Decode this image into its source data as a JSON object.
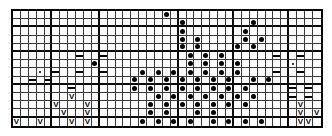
{
  "chart": {
    "type": "stitch-grid",
    "columns": 39,
    "rows": 14,
    "colors": {
      "background": "#ffffff",
      "grid_line": "#3a3a3a",
      "heavy_line": "#0a0a0a",
      "symbol": "#000000"
    },
    "symbol_legend": [
      {
        "key": "dot",
        "name": "filled-dot",
        "glyph": "●"
      },
      {
        "key": "smalldot",
        "name": "small-dot",
        "glyph": "·"
      },
      {
        "key": "dash",
        "name": "dash",
        "glyph": "—"
      },
      {
        "key": "vee",
        "name": "vee-mark",
        "glyph": "V"
      },
      {
        "key": "stipple",
        "name": "stipple-mark",
        "glyph": "∴"
      },
      {
        "key": "",
        "name": "empty-cell",
        "glyph": ""
      }
    ],
    "heavy_column_dividers": [
      4,
      10,
      20,
      27,
      34
    ],
    "heavy_row_dividers": [
      1,
      4,
      8,
      12
    ],
    "cells": [
      [
        "",
        "",
        "",
        "",
        "",
        "",
        "",
        "",
        "",
        "",
        "",
        "",
        "",
        "",
        "",
        "",
        "",
        "",
        "",
        "dot",
        "",
        "",
        "",
        "",
        "",
        "",
        "",
        "",
        "",
        "",
        "",
        "",
        "",
        "",
        "",
        "",
        "",
        "",
        ""
      ],
      [
        "",
        "",
        "",
        "",
        "",
        "",
        "",
        "",
        "",
        "",
        "",
        "",
        "",
        "",
        "",
        "",
        "",
        "",
        "",
        "",
        "",
        "dot",
        "",
        "",
        "",
        "",
        "",
        "",
        "",
        "",
        "dot",
        "",
        "",
        "",
        "",
        "",
        "",
        "",
        ""
      ],
      [
        "",
        "",
        "",
        "",
        "",
        "",
        "",
        "",
        "",
        "",
        "",
        "",
        "",
        "",
        "",
        "",
        "",
        "",
        "",
        "",
        "",
        "dot",
        "",
        "",
        "",
        "",
        "",
        "",
        "",
        "dot",
        "",
        "",
        "",
        "",
        "",
        "",
        "",
        "",
        ""
      ],
      [
        "",
        "",
        "",
        "",
        "",
        "",
        "",
        "",
        "",
        "",
        "",
        "",
        "",
        "",
        "",
        "",
        "",
        "",
        "",
        "",
        "",
        "dot",
        "",
        "dot",
        "",
        "",
        "",
        "",
        "",
        "dot",
        "",
        "dot",
        "",
        "",
        "",
        "",
        "",
        "",
        ""
      ],
      [
        "",
        "",
        "",
        "",
        "",
        "",
        "",
        "",
        "",
        "",
        "",
        "",
        "",
        "",
        "",
        "",
        "",
        "",
        "",
        "",
        "",
        "dot",
        "",
        "dot",
        "",
        "",
        "",
        "",
        "dot",
        "",
        "dot",
        "",
        "",
        "",
        "",
        "",
        "",
        "",
        ""
      ],
      [
        "",
        "",
        "",
        "",
        "",
        "",
        "",
        "",
        "dash",
        "",
        "",
        "dash",
        "",
        "",
        "",
        "",
        "",
        "",
        "",
        "",
        "",
        "",
        "dot",
        "",
        "dot",
        "",
        "dot",
        "",
        "",
        "",
        "",
        "",
        "",
        "dash",
        "",
        "",
        "dash",
        "",
        ""
      ],
      [
        "",
        "",
        "",
        "",
        "",
        "",
        "",
        "",
        "",
        "",
        "dot",
        "",
        "",
        "",
        "",
        "",
        "",
        "",
        "",
        "",
        "",
        "",
        "dot",
        "",
        "dot",
        "",
        "dot",
        "",
        "dot",
        "",
        "",
        "",
        "",
        "",
        "",
        "smalldot",
        "",
        "",
        ""
      ],
      [
        "",
        "",
        "",
        "smalldot",
        "",
        "dash",
        "",
        "",
        "dash",
        "",
        "",
        "dash",
        "",
        "",
        "",
        "",
        "dot",
        "",
        "dot",
        "",
        "dot",
        "",
        "dot",
        "",
        "dot",
        "",
        "dot",
        "",
        "dot",
        "",
        "",
        "",
        "",
        "dash",
        "",
        "",
        "dash",
        "",
        "",
        ""
      ],
      [
        "",
        "",
        "dash",
        "",
        "dash",
        "",
        "",
        "",
        "",
        "",
        "",
        "",
        "",
        "",
        "",
        "dot",
        "",
        "dot",
        "",
        "dot",
        "",
        "dot",
        "",
        "dot",
        "",
        "dot",
        "",
        "dot",
        "stipple",
        "",
        "dot",
        "",
        "dot",
        "",
        "",
        "",
        "",
        "",
        "",
        ""
      ],
      [
        "",
        "",
        "",
        "",
        "",
        "",
        "",
        "dash",
        "",
        "",
        "",
        "",
        "",
        "",
        "",
        "dot",
        "",
        "dot",
        "",
        "dot",
        "",
        "dot",
        "",
        "dot",
        "",
        "dot",
        "",
        "dot",
        "",
        "dot",
        "",
        "stipple",
        "",
        "",
        "",
        "dash",
        "",
        "dash",
        "",
        ""
      ],
      [
        "",
        "",
        "",
        "",
        "",
        "",
        "",
        "vee",
        "",
        "",
        "",
        "",
        "",
        "",
        "stipple",
        "",
        "stipple",
        "",
        "dot",
        "",
        "dot",
        "",
        "dot",
        "",
        "dot",
        "",
        "dot",
        "",
        "dot",
        "",
        "dot",
        "",
        "",
        "",
        "",
        "dash",
        "",
        "dash",
        "",
        ""
      ],
      [
        "",
        "",
        "",
        "",
        "",
        "vee",
        "",
        "",
        "",
        "vee",
        "",
        "",
        "",
        "",
        "",
        "stipple",
        "",
        "dot",
        "",
        "dot",
        "",
        "dot",
        "",
        "dot",
        "",
        "dot",
        "",
        "dot",
        "",
        "dot",
        "",
        "",
        "",
        "",
        "",
        "",
        "vee",
        "",
        "",
        ""
      ],
      [
        "",
        "",
        "",
        "",
        "",
        "",
        "vee",
        "",
        "",
        "vee",
        "",
        "",
        "",
        "",
        "",
        "",
        "",
        "dot",
        "",
        "dot",
        "",
        "",
        "",
        "dot",
        "",
        "dot",
        "",
        "",
        "",
        "",
        "",
        "",
        "",
        "",
        "",
        "",
        "vee",
        "",
        "vee",
        ""
      ],
      [
        "vee",
        "",
        "",
        "vee",
        "",
        "",
        "",
        "vee",
        "",
        "vee",
        "",
        "",
        "",
        "",
        "",
        "",
        "dot",
        "",
        "dot",
        "",
        "dot",
        "",
        "dot",
        "",
        "",
        "dot",
        "",
        "dot",
        "",
        "dot",
        "",
        "dot",
        "",
        "",
        "",
        "",
        "vee",
        "vee",
        "",
        ""
      ]
    ]
  }
}
